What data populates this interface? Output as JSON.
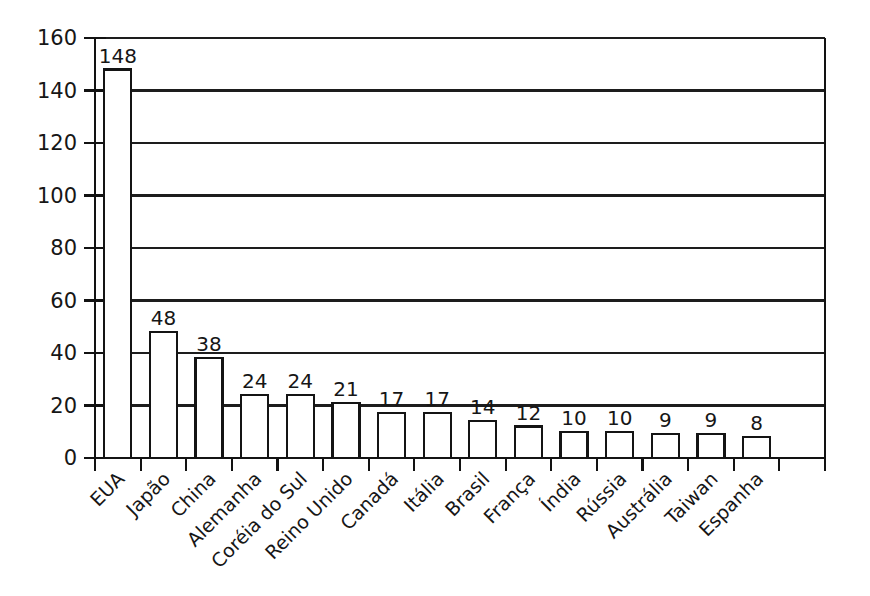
{
  "chart_data": {
    "type": "bar",
    "title": "",
    "subtitle": "",
    "xlabel": "",
    "ylabel": "",
    "ylim": [
      0,
      160
    ],
    "ytick_step": 20,
    "yticks": [
      "0",
      "20",
      "40",
      "60",
      "80",
      "100",
      "120",
      "140",
      "160"
    ],
    "grid": "horizontal",
    "legend": "none",
    "orientation": "vertical",
    "bar_style": "outline",
    "category_label_rotation": "45",
    "categories": [
      "EUA",
      "Japão",
      "China",
      "Alemanha",
      "Coréia do Sul",
      "Reino Unido",
      "Canadá",
      "Itália",
      "Brasil",
      "França",
      "Índia",
      "Rússia",
      "Austrália",
      "Taiwan",
      "Espanha"
    ],
    "values": [
      148,
      48,
      38,
      24,
      24,
      21,
      17,
      17,
      14,
      12,
      10,
      10,
      9,
      9,
      8
    ],
    "value_labels": [
      "148",
      "48",
      "38",
      "24",
      "24",
      "21",
      "17",
      "17",
      "14",
      "12",
      "10",
      "10",
      "9",
      "9",
      "8"
    ],
    "colors": {
      "background": "#ffffff",
      "axis": "#121212",
      "grid": "#1d1d1d",
      "bar_fill": "#ffffff",
      "bar_stroke": "#141414",
      "text": "#161616"
    }
  }
}
